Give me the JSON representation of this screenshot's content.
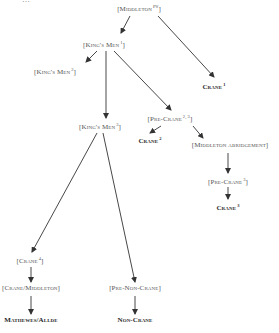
{
  "diagram": {
    "type": "stemma",
    "truncated_top_text": "…",
    "nodes": [
      {
        "id": "middleton-pw",
        "label": "[Middleton",
        "sup": "Pw",
        "close": "]",
        "x": 139,
        "y": 6,
        "style": "bracket"
      },
      {
        "id": "kings-men-1",
        "label": "[King's Men",
        "sup": "1",
        "close": "]",
        "x": 104,
        "y": 42,
        "style": "bracket"
      },
      {
        "id": "crane-1",
        "label": "Crane",
        "sup": "1",
        "close": "",
        "x": 214,
        "y": 84,
        "style": "bold"
      },
      {
        "id": "kings-men-2",
        "label": "[King's Men",
        "sup": "2",
        "close": "]",
        "x": 55,
        "y": 69,
        "style": "bracket"
      },
      {
        "id": "kings-men-3",
        "label": "[King's Men",
        "sup": "3",
        "close": "]",
        "x": 100,
        "y": 124,
        "style": "bracket"
      },
      {
        "id": "pre-crane-23",
        "label": "[Pre-Crane",
        "sup": "2, 3",
        "close": "]",
        "x": 170,
        "y": 116,
        "style": "bracket"
      },
      {
        "id": "crane-2",
        "label": "Crane",
        "sup": "2",
        "close": "",
        "x": 150,
        "y": 138,
        "style": "bold"
      },
      {
        "id": "middleton-abridgement",
        "label": "[Middleton abridgement]",
        "sup": "",
        "close": "",
        "x": 230,
        "y": 145,
        "style": "bracket"
      },
      {
        "id": "pre-crane-3",
        "label": "[Pre-Crane",
        "sup": "3",
        "close": "]",
        "x": 228,
        "y": 179,
        "style": "bracket"
      },
      {
        "id": "crane-3",
        "label": "Crane",
        "sup": "3",
        "close": "",
        "x": 228,
        "y": 205,
        "style": "bold"
      },
      {
        "id": "crane-4",
        "label": "[Crane",
        "sup": "4",
        "close": "]",
        "x": 30,
        "y": 258,
        "style": "bracket"
      },
      {
        "id": "crane-middleton",
        "label": "[Crane/Middleton]",
        "sup": "",
        "close": "",
        "x": 31,
        "y": 288,
        "style": "bracket"
      },
      {
        "id": "mathewes-allde",
        "label": "Mathewes/Allde",
        "sup": "",
        "close": "",
        "x": 31,
        "y": 320,
        "style": "bold"
      },
      {
        "id": "pre-non-crane",
        "label": "[Pre-Non-Crane]",
        "sup": "",
        "close": "",
        "x": 135,
        "y": 288,
        "style": "bracket"
      },
      {
        "id": "non-crane",
        "label": "Non-Crane",
        "sup": "",
        "close": "",
        "x": 135,
        "y": 320,
        "style": "bold"
      }
    ],
    "edges": [
      {
        "from": "middleton-pw",
        "to": "kings-men-1",
        "x1": 130,
        "y1": 16,
        "x2": 121,
        "y2": 33,
        "arrow": true
      },
      {
        "from": "middleton-pw",
        "to": "crane-1",
        "x1": 158,
        "y1": 16,
        "x2": 214,
        "y2": 77,
        "arrow": true
      },
      {
        "from": "kings-men-1",
        "to": "kings-men-2",
        "x1": 97,
        "y1": 51,
        "x2": 86,
        "y2": 62,
        "arrow": true
      },
      {
        "from": "kings-men-1",
        "to": "kings-men-3",
        "x1": 106,
        "y1": 51,
        "x2": 106,
        "y2": 118,
        "arrow": true
      },
      {
        "from": "kings-men-1",
        "to": "pre-crane-23",
        "x1": 114,
        "y1": 51,
        "x2": 171,
        "y2": 110,
        "arrow": true
      },
      {
        "from": "pre-crane-23",
        "to": "crane-2",
        "x1": 161,
        "y1": 126,
        "x2": 150,
        "y2": 133,
        "arrow": true
      },
      {
        "from": "pre-crane-23",
        "to": "middleton-abridgement",
        "x1": 193,
        "y1": 126,
        "x2": 203,
        "y2": 138,
        "arrow": true
      },
      {
        "from": "middleton-abridgement",
        "to": "pre-crane-3",
        "x1": 228,
        "y1": 153,
        "x2": 228,
        "y2": 173,
        "arrow": true
      },
      {
        "from": "pre-crane-3",
        "to": "crane-3",
        "x1": 228,
        "y1": 187,
        "x2": 228,
        "y2": 199,
        "arrow": true
      },
      {
        "from": "kings-men-3",
        "to": "crane-4",
        "x1": 97,
        "y1": 133,
        "x2": 32,
        "y2": 252,
        "arrow": true
      },
      {
        "from": "kings-men-3",
        "to": "pre-non-crane",
        "x1": 103,
        "y1": 133,
        "x2": 135,
        "y2": 282,
        "arrow": true
      },
      {
        "from": "crane-4",
        "to": "crane-middleton",
        "x1": 31,
        "y1": 267,
        "x2": 31,
        "y2": 282,
        "arrow": true
      },
      {
        "from": "crane-middleton",
        "to": "mathewes-allde",
        "x1": 31,
        "y1": 296,
        "x2": 31,
        "y2": 314,
        "arrow": true
      },
      {
        "from": "pre-non-crane",
        "to": "non-crane",
        "x1": 135,
        "y1": 296,
        "x2": 135,
        "y2": 314,
        "arrow": true
      }
    ],
    "colors": {
      "line": "#333333",
      "text": "#2a2a2a",
      "bracket_text": "#555555"
    }
  }
}
